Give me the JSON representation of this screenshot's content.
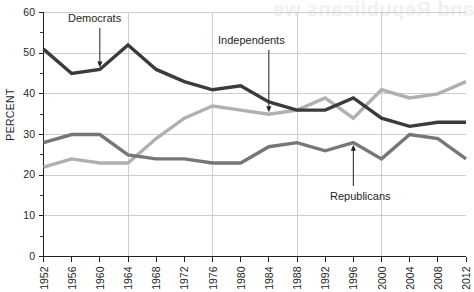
{
  "chart_data": {
    "type": "line",
    "title": "",
    "xlabel": "",
    "ylabel": "PERCENT",
    "categories": [
      "1952",
      "1956",
      "1960",
      "1964",
      "1968",
      "1972",
      "1976",
      "1980",
      "1984",
      "1988",
      "1992",
      "1996",
      "2000",
      "2004",
      "2008",
      "2012"
    ],
    "x": [
      1952,
      1956,
      1960,
      1964,
      1968,
      1972,
      1976,
      1980,
      1984,
      1988,
      1992,
      1996,
      2000,
      2004,
      2008,
      2012
    ],
    "xlim": [
      1952,
      2012
    ],
    "ylim": [
      0,
      60
    ],
    "ytick_step": 10,
    "ytick_minor_step": 5,
    "yticks": [
      0,
      10,
      20,
      30,
      40,
      50,
      60
    ],
    "grid": "horizontal gridlines at every 10 percent; vertical gridlines at 1964, 1976, 1988, 2000",
    "gridlines_vertical_at": [
      1964,
      1976,
      1988,
      2000
    ],
    "legend": "inline annotations with arrows",
    "series": [
      {
        "name": "Democrats",
        "color": "#3b3b3b",
        "values": [
          51,
          45,
          46,
          52,
          46,
          43,
          41,
          42,
          38,
          36,
          36,
          39,
          34,
          32,
          33,
          33
        ]
      },
      {
        "name": "Independents",
        "color": "#b0b0b0",
        "values": [
          22,
          24,
          23,
          23,
          29,
          34,
          37,
          36,
          35,
          36,
          39,
          34,
          41,
          39,
          40,
          43
        ]
      },
      {
        "name": "Republicans",
        "color": "#767676",
        "values": [
          28,
          30,
          30,
          25,
          24,
          24,
          23,
          23,
          27,
          28,
          26,
          28,
          24,
          30,
          29,
          24
        ]
      }
    ],
    "annotations": [
      {
        "label": "Democrats",
        "points_to_year": 1960,
        "points_to_value": 46,
        "direction": "down"
      },
      {
        "label": "Independents",
        "points_to_year": 1984,
        "points_to_value": 35,
        "direction": "down"
      },
      {
        "label": "Republicans",
        "points_to_year": 1996,
        "points_to_value": 28,
        "direction": "up"
      }
    ]
  },
  "axis": {
    "y_title": "PERCENT",
    "y_tick_labels": [
      "0",
      "10",
      "20",
      "30",
      "40",
      "50",
      "60"
    ],
    "x_tick_labels": [
      "1952",
      "1956",
      "1960",
      "1964",
      "1968",
      "1972",
      "1976",
      "1980",
      "1984",
      "1988",
      "1992",
      "1996",
      "2000",
      "2004",
      "2008",
      "2012"
    ]
  },
  "annotations": {
    "democrats": "Democrats",
    "independents": "Independents",
    "republicans": "Republicans"
  },
  "artifacts": {
    "bleed_through_top": "and Republicans we",
    "bleed_through_body": "faint reverse-side print"
  }
}
